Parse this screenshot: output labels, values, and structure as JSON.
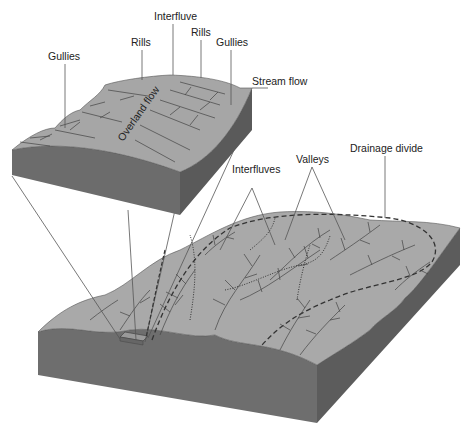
{
  "diagram": {
    "inset": {
      "labels": [
        {
          "id": "gullies-left",
          "text": "Gullies",
          "x": 48,
          "y": 60
        },
        {
          "id": "rills-left",
          "text": "Rills",
          "x": 131,
          "y": 46
        },
        {
          "id": "interfluve",
          "text": "Interfluve",
          "x": 154,
          "y": 20
        },
        {
          "id": "rills-right",
          "text": "Rills",
          "x": 191,
          "y": 36
        },
        {
          "id": "gullies-right",
          "text": "Gullies",
          "x": 216,
          "y": 46
        },
        {
          "id": "stream-flow",
          "text": "Stream flow",
          "x": 252,
          "y": 85
        }
      ],
      "flow_label": "Overland flow"
    },
    "main": {
      "labels": [
        {
          "id": "interfluves",
          "text": "Interfluves",
          "x": 232,
          "y": 173
        },
        {
          "id": "valleys",
          "text": "Valleys",
          "x": 296,
          "y": 163
        },
        {
          "id": "drainage-divide",
          "text": "Drainage divide",
          "x": 350,
          "y": 152
        }
      ]
    },
    "colors": {
      "surface": "#a9a9a9",
      "side_front": "#6d6d6d",
      "side_right": "#5e5e5e",
      "lines": "#444444"
    }
  }
}
